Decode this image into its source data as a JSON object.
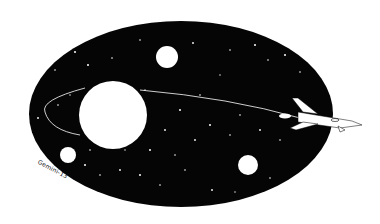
{
  "illustration": {
    "subject": "space scene with planets, starfield and rocket",
    "colors": {
      "background": "#ffffff",
      "space": "#050505",
      "objects": "#ffffff"
    },
    "oval": {
      "cx": 181,
      "cy": 114,
      "rx": 152,
      "ry": 93
    },
    "planets": [
      {
        "name": "large-planet",
        "cx": 113,
        "cy": 115,
        "r": 34
      },
      {
        "name": "top-planet",
        "cx": 167,
        "cy": 57,
        "r": 11
      },
      {
        "name": "lower-left-planet",
        "cx": 68,
        "cy": 155,
        "r": 8
      },
      {
        "name": "lower-right-planet",
        "cx": 248,
        "cy": 165,
        "r": 10
      }
    ],
    "signature": "Gemini-13"
  }
}
